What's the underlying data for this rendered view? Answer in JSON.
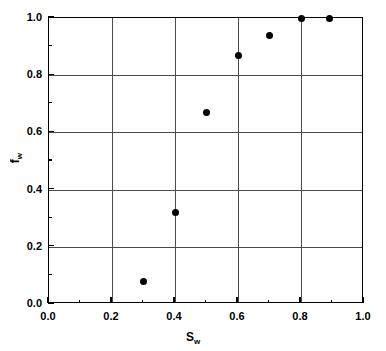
{
  "chart_data": {
    "type": "scatter",
    "title": "",
    "xlabel": "S_w",
    "ylabel": "f_w",
    "xlabel_base": "S",
    "xlabel_sub": "w",
    "ylabel_base": "f",
    "ylabel_sub": "w",
    "xlim": [
      0.0,
      1.0
    ],
    "ylim": [
      0.0,
      1.0
    ],
    "grid": true,
    "grid_major_x": [
      0.2,
      0.4,
      0.6,
      0.8
    ],
    "grid_major_y": [
      0.2,
      0.4,
      0.6,
      0.8
    ],
    "legend": null,
    "x_major_ticks": [
      0.0,
      0.2,
      0.4,
      0.6,
      0.8,
      1.0
    ],
    "x_major_ticklabels": [
      "0.0",
      "0.2",
      "0.4",
      "0.6",
      "0.8",
      "1.0"
    ],
    "x_minor_ticks": [
      0.1,
      0.3,
      0.5,
      0.7,
      0.9
    ],
    "y_major_ticks": [
      0.0,
      0.2,
      0.4,
      0.6,
      0.8,
      1.0
    ],
    "y_major_ticklabels": [
      "0.0",
      "0.2",
      "0.4",
      "0.6",
      "0.8",
      "1.0"
    ],
    "y_minor_ticks": [
      0.1,
      0.3,
      0.5,
      0.7,
      0.9
    ],
    "marker": "filled-circle",
    "marker_color": "#000000",
    "x": [
      0.3,
      0.4,
      0.5,
      0.6,
      0.7,
      0.8,
      0.89
    ],
    "values": [
      0.08,
      0.32,
      0.67,
      0.87,
      0.94,
      1.0,
      1.0
    ],
    "points": [
      {
        "x": 0.3,
        "y": 0.08
      },
      {
        "x": 0.4,
        "y": 0.32
      },
      {
        "x": 0.5,
        "y": 0.67
      },
      {
        "x": 0.6,
        "y": 0.87
      },
      {
        "x": 0.7,
        "y": 0.94
      },
      {
        "x": 0.8,
        "y": 1.0
      },
      {
        "x": 0.89,
        "y": 1.0
      }
    ]
  },
  "colors": {
    "axis": "#000000",
    "grid": "#4a4a4a",
    "marker": "#000000",
    "background": "#ffffff"
  }
}
